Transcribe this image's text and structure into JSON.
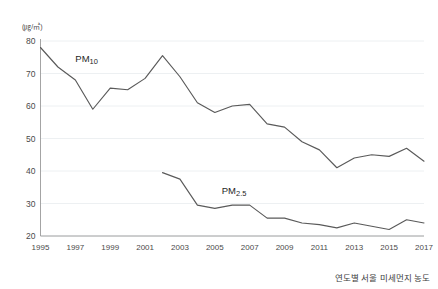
{
  "chart_data": {
    "type": "line",
    "title": "",
    "caption": "연도별 서울 미세먼지 농도",
    "unit_label": "(㎍/㎥)",
    "xlabel": "",
    "ylabel": "",
    "x": [
      1995,
      1996,
      1997,
      1998,
      1999,
      2000,
      2001,
      2002,
      2003,
      2004,
      2005,
      2006,
      2007,
      2008,
      2009,
      2010,
      2011,
      2012,
      2013,
      2014,
      2015,
      2016,
      2017
    ],
    "xticks": [
      "1995",
      "1997",
      "1999",
      "2001",
      "2003",
      "2005",
      "2007",
      "2009",
      "2011",
      "2013",
      "2015",
      "2017"
    ],
    "xtick_values": [
      1995,
      1997,
      1999,
      2001,
      2003,
      2005,
      2007,
      2009,
      2011,
      2013,
      2015,
      2017
    ],
    "yticks": [
      20,
      30,
      40,
      50,
      60,
      70,
      80
    ],
    "ytick_labels": [
      "20",
      "30",
      "40",
      "50",
      "60",
      "70",
      "80"
    ],
    "xlim": [
      1995,
      2017
    ],
    "ylim": [
      20,
      80
    ],
    "grid": true,
    "legend_position": "inline-annotation",
    "line_color": "#5a5a5a",
    "grid_color": "#e9ecef",
    "axis_color": "#9a9a9a",
    "series": [
      {
        "name": "PM10",
        "label_main": "PM",
        "label_sub": "10",
        "label_x": 1997.0,
        "label_y": 73.5,
        "x": [
          1995,
          1996,
          1997,
          1998,
          1999,
          2000,
          2001,
          2002,
          2003,
          2004,
          2005,
          2006,
          2007,
          2008,
          2009,
          2010,
          2011,
          2012,
          2013,
          2014,
          2015,
          2016,
          2017
        ],
        "values": [
          78.0,
          72.0,
          68.0,
          59.0,
          65.5,
          65.0,
          68.5,
          75.5,
          69.0,
          61.0,
          58.0,
          60.0,
          60.5,
          54.5,
          53.5,
          49.0,
          46.5,
          41.0,
          44.0,
          45.0,
          44.5,
          47.0,
          43.0
        ]
      },
      {
        "name": "PM2.5",
        "label_main": "PM",
        "label_sub": "2.5",
        "label_x": 2005.4,
        "label_y": 33.0,
        "x": [
          2002,
          2003,
          2004,
          2005,
          2006,
          2007,
          2008,
          2009,
          2010,
          2011,
          2012,
          2013,
          2014,
          2015,
          2016,
          2017
        ],
        "values": [
          39.5,
          37.5,
          29.5,
          28.5,
          29.5,
          29.5,
          25.5,
          25.5,
          24.0,
          23.5,
          22.5,
          24.0,
          23.0,
          22.0,
          25.0,
          24.0
        ]
      }
    ]
  }
}
